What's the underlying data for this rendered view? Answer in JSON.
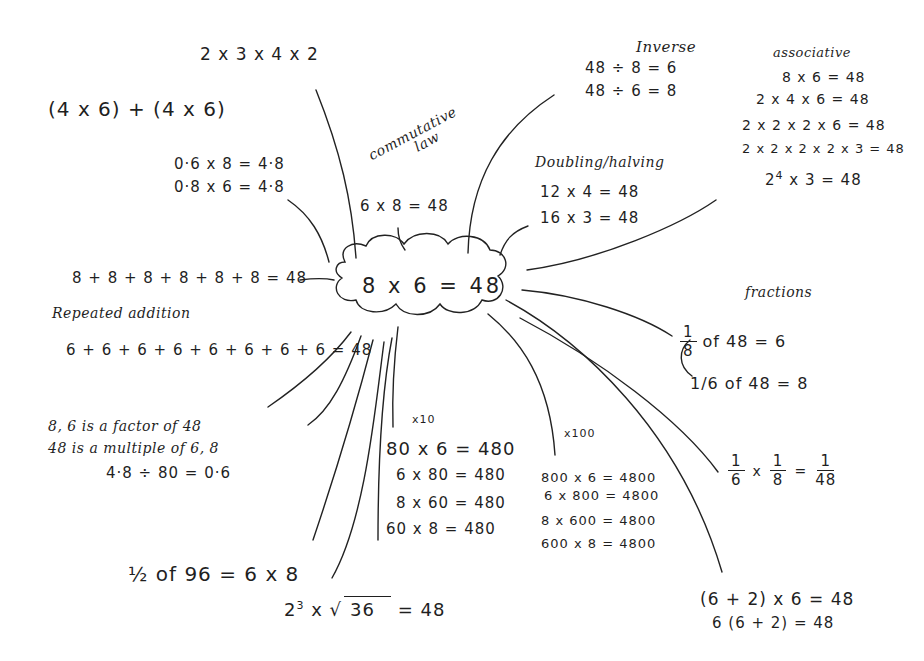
{
  "center": {
    "equation": "8 x 6 = 48"
  },
  "branches": {
    "factors_product": {
      "text": "2 x 3 x 4 x 2"
    },
    "distributive_sum": {
      "text": "(4 x 6) + (4 x 6)"
    },
    "decimals": {
      "lines": [
        "0·6 x 8  = 4·8",
        "0·8 x 6  = 4·8"
      ]
    },
    "commutative": {
      "label": "commutative law",
      "label_line1": "commutative",
      "label_line2": "law",
      "equation": "6 x 8 = 48"
    },
    "inverse": {
      "label": "Inverse",
      "lines": [
        "48 ÷ 8 = 6",
        "48 ÷ 6 = 8"
      ]
    },
    "associative": {
      "label": "associative",
      "lines": [
        "8 x 6 = 48",
        "2 x 4  x 6 = 48",
        "2 x 2 x 2 x 6 = 48",
        "2 x 2 x 2 x 2 x 3 = 48"
      ],
      "power_line": {
        "base": "2",
        "exponent": "4",
        "rest": " x 3 = 48"
      }
    },
    "doubling_halving": {
      "label": "Doubling/halving",
      "lines": [
        "12 x 4  = 48",
        "16 x 3  = 48"
      ]
    },
    "repeated_addition": {
      "label": "Repeated addition",
      "line_eights": "8 + 8 + 8 + 8 + 8 + 8  = 48",
      "line_sixes": "6 + 6 + 6 + 6 + 6 + 6 + 6 + 6  = 48"
    },
    "fractions": {
      "label": "fractions",
      "eighth": {
        "num": "1",
        "den": "8",
        "rest": "of 48 = 6"
      },
      "sixth": {
        "prefix": "1/6",
        "rest": "of 48 = 8"
      }
    },
    "factors_multiples": {
      "line1": "8, 6 is a factor of 48",
      "line2": "48 is a multiple of 6, 8",
      "line3": "4·8 ÷ 80 = 0·6"
    },
    "times_ten": {
      "label": "x10",
      "lines": [
        "80 x  6 = 480",
        "6 x 80  = 480",
        "8 x 60   = 480",
        "60  x 8      = 480"
      ]
    },
    "times_hundred": {
      "label": "x100",
      "lines": [
        "800 x 6 = 4800",
        "6 x 800 = 4800",
        "8 x 600  = 4800",
        "600 x 8 = 4800"
      ]
    },
    "fraction_product": {
      "a_num": "1",
      "a_den": "6",
      "op": "x",
      "b_num": "1",
      "b_den": "8",
      "eq": "=",
      "r_num": "1",
      "r_den": "48"
    },
    "half_of": {
      "text": "½ of 96 = 6 x 8"
    },
    "power_root": {
      "base": "2",
      "exponent": "3",
      "op": " x ",
      "radicand": "36",
      "result": "= 48"
    },
    "brackets": {
      "lines": [
        "(6 + 2) x 6   = 48",
        "6 (6 + 2)     = 48"
      ]
    }
  },
  "colors": {
    "ink": "#1f1f1f",
    "paper": "#ffffff"
  }
}
